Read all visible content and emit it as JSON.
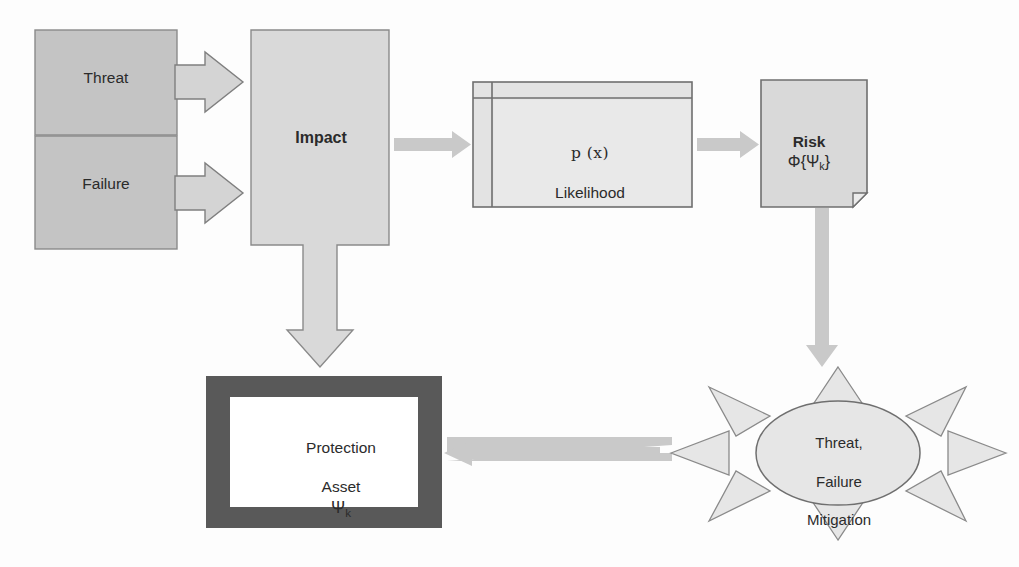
{
  "diagram": {
    "background_color": "#fdfdfd",
    "palette": {
      "box_fill_dark": "#c4c4c4",
      "box_fill_light": "#d9d9d9",
      "shape_stroke": "#7f7f7f",
      "connector_gray": "#c9c9c9",
      "asset_border": "#595959",
      "asset_inner": "#ffffff",
      "text_color": "#2b2b2b"
    },
    "nodes": [
      {
        "id": "threat",
        "name": "threat-box",
        "shape": "rectangle",
        "label": "Threat",
        "bold": false,
        "fill": "#c4c4c4"
      },
      {
        "id": "failure",
        "name": "failure-box",
        "shape": "rectangle",
        "label": "Failure",
        "bold": false,
        "fill": "#c4c4c4"
      },
      {
        "id": "impact",
        "name": "impact-box",
        "shape": "rectangle",
        "label": "Impact",
        "bold": true,
        "fill": "#d9d9d9"
      },
      {
        "id": "likelihood",
        "name": "likelihood-table",
        "shape": "table",
        "label_line1": "p (x)",
        "label_line2": "Likelihood",
        "fill": "#e3e3e3"
      },
      {
        "id": "risk",
        "name": "risk-document",
        "shape": "document-folded-corner",
        "label_line1": "Risk",
        "label_line2_prefix": "Φ{Ψ",
        "label_line2_sub": "k",
        "label_line2_suffix": "}",
        "fill": "#d9d9d9"
      },
      {
        "id": "mitigation",
        "name": "mitigation-starburst",
        "shape": "sun-explosion",
        "label_line1": "Threat,",
        "label_line2": "Failure",
        "label_line3": "Mitigation",
        "ray_count": 8,
        "fill": "#e6e6e6"
      },
      {
        "id": "asset",
        "name": "protection-asset-box",
        "shape": "thick-framed-rectangle",
        "label_line1": "Protection",
        "label_line2": "Asset",
        "label_line3_prefix": "Ψ",
        "label_line3_sub": "k",
        "border_color": "#595959",
        "fill": "#ffffff"
      }
    ],
    "connectors": [
      {
        "id": "c1",
        "name": "arrow-threat-to-impact",
        "from": "threat",
        "to": "impact",
        "style": "block-outlined",
        "direction": "right"
      },
      {
        "id": "c2",
        "name": "arrow-failure-to-impact",
        "from": "failure",
        "to": "impact",
        "style": "block-outlined",
        "direction": "right"
      },
      {
        "id": "c3",
        "name": "arrow-impact-to-likelihood",
        "from": "impact",
        "to": "likelihood",
        "style": "flat-gray",
        "direction": "right"
      },
      {
        "id": "c4",
        "name": "arrow-likelihood-to-risk",
        "from": "likelihood",
        "to": "risk",
        "style": "flat-gray",
        "direction": "right"
      },
      {
        "id": "c5",
        "name": "arrow-impact-to-asset",
        "from": "impact",
        "to": "asset",
        "style": "block-outlined",
        "direction": "down"
      },
      {
        "id": "c6",
        "name": "arrow-risk-to-mitigation",
        "from": "risk",
        "to": "mitigation",
        "style": "flat-gray",
        "direction": "down"
      },
      {
        "id": "c7",
        "name": "arrow-mitigation-to-asset",
        "from": "mitigation",
        "to": "asset",
        "style": "flat-gray",
        "direction": "left"
      }
    ]
  }
}
